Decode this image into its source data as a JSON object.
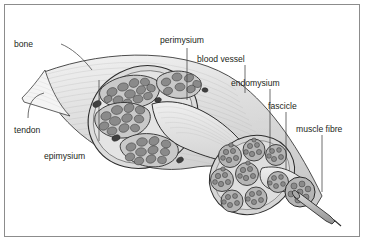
{
  "figure": {
    "type": "anatomical-diagram",
    "background_color": "#ffffff",
    "border_color": "#8c8c8c",
    "ink_color": "#231f20",
    "fill_light": "#e8e8e8",
    "fill_mid": "#bdbdbd",
    "fill_dark": "#6e6e6e",
    "vessel_color": "#4a4a4a"
  },
  "labels": {
    "bone": "bone",
    "tendon": "tendon",
    "epimysium": "epimysium",
    "perimysium": "perimysium",
    "blood_vessel": "blood vessel",
    "endomysium": "endomysium",
    "fascicle": "fascicle",
    "muscle_fibre": "muscle fibre"
  },
  "structures": {
    "muscle_belly": "muscle-belly",
    "tendon_shape": "tendon-taper",
    "cross_section_main": "main-cross-section",
    "cross_section_secondary": "fascicle-bundle-cross-section",
    "fascicle_tip": "terminal-fascicle",
    "fibre_rod": "single-muscle-fibre"
  }
}
